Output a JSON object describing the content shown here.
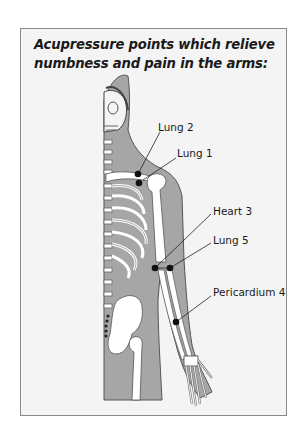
{
  "title": "Acupressure points which relieve numbness and pain in the arms:",
  "colors": {
    "frame_border": "#8a8a8a",
    "background": "#f4f4f4",
    "body_fill": "#a6a6a6",
    "bone": "#ffffff",
    "outline": "#555555",
    "point": "#111111"
  },
  "points": [
    {
      "id": "lung-2",
      "label": "Lung 2",
      "dot": [
        138,
        174
      ],
      "label_pos": [
        158,
        121
      ]
    },
    {
      "id": "lung-1",
      "label": "Lung 1",
      "dot": [
        139,
        183
      ],
      "label_pos": [
        177,
        147
      ]
    },
    {
      "id": "heart-3",
      "label": "Heart 3",
      "dot": [
        155,
        268
      ],
      "label_pos": [
        213,
        205
      ]
    },
    {
      "id": "lung-5",
      "label": "Lung 5",
      "dot": [
        170,
        268
      ],
      "label_pos": [
        213,
        234
      ]
    },
    {
      "id": "pericardium-4",
      "label": "Pericardium 4",
      "dot": [
        176,
        322
      ],
      "label_pos": [
        213,
        286
      ]
    }
  ]
}
